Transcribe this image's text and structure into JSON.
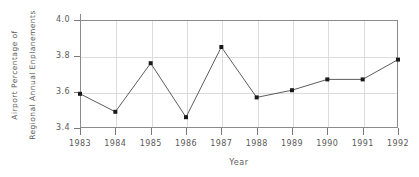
{
  "chart_data": {
    "type": "line",
    "title": "",
    "xlabel": "Year",
    "ylabel": "Airport Percentage of Regional Annual Enplanements",
    "ylabel_lines": [
      "Airport Percentage of",
      "Regional Annual Enplanements"
    ],
    "categories": [
      1983,
      1984,
      1985,
      1986,
      1987,
      1988,
      1989,
      1990,
      1991,
      1992
    ],
    "x_tick_labels": [
      "1983",
      "1984",
      "1985",
      "1986",
      "1987",
      "1988",
      "1989",
      "1990",
      "1991",
      "1992"
    ],
    "values": [
      3.59,
      3.49,
      3.76,
      3.46,
      3.85,
      3.57,
      3.61,
      3.67,
      3.67,
      3.78
    ],
    "y_tick_labels": [
      "4.0",
      "3.8",
      "3.6",
      "3.4"
    ],
    "y_ticks": [
      4.0,
      3.8,
      3.6,
      3.4
    ],
    "ylim": [
      3.4,
      4.0
    ],
    "grid": true,
    "legend": null,
    "marker": "square",
    "line_color": "#4a4a4a",
    "marker_color": "#1a1a1a",
    "grid_color": "#dcdcdc",
    "axis_color": "#8b8b8b",
    "text_color": "#5a5a5a"
  }
}
